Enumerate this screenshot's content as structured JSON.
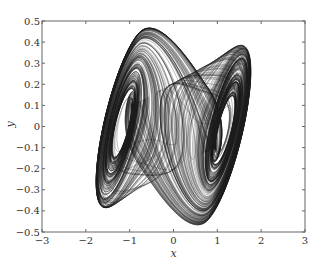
{
  "chart_data": {
    "type": "line",
    "title": "",
    "xlabel": "x",
    "ylabel": "y",
    "xlim": [
      -3,
      3
    ],
    "ylim": [
      -0.5,
      0.5
    ],
    "xticks": [
      -3,
      -2,
      -1,
      0,
      1,
      2,
      3
    ],
    "yticks": [
      -0.5,
      -0.4,
      -0.3,
      -0.2,
      -0.1,
      0,
      0.1,
      0.2,
      0.3,
      0.4,
      0.5
    ],
    "xtick_labels": [
      "−3",
      "−2",
      "−1",
      "0",
      "1",
      "2",
      "3"
    ],
    "ytick_labels": [
      "−0.5",
      "−0.4",
      "−0.3",
      "−0.2",
      "−0.1",
      "0",
      "0.1",
      "0.2",
      "0.3",
      "0.4",
      "0.5"
    ],
    "grid": false,
    "legend": null,
    "series": [
      {
        "name": "trajectory",
        "color": "#1a1a1a",
        "features": {
          "left_scroll_center": [
            -1.5,
            0.0
          ],
          "right_scroll_center": [
            1.5,
            0.0
          ],
          "x_range_observed": [
            -2.2,
            2.25
          ],
          "y_range_observed": [
            -0.4,
            0.4
          ],
          "left_lobe_top": [
            -1.2,
            0.4
          ],
          "left_lobe_bottom": [
            -1.8,
            -0.33
          ],
          "right_lobe_top": [
            1.9,
            0.33
          ],
          "right_lobe_bottom": [
            1.0,
            -0.4
          ]
        }
      }
    ]
  },
  "plot": {
    "area": {
      "left": 42,
      "top": 21,
      "right": 305,
      "bottom": 232
    },
    "line_color": "#1a1a1a",
    "axis_color": "#555555",
    "steps": 60000
  }
}
